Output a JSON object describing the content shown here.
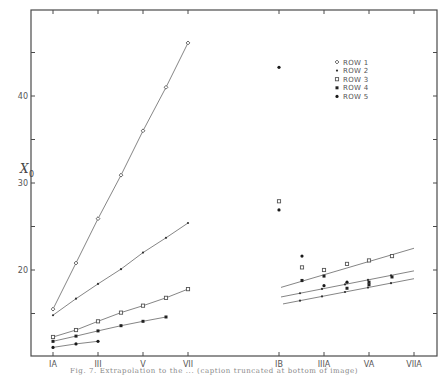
{
  "chart_data": {
    "type": "scatter",
    "title": "",
    "caption": "Fig. 7. Extrapolation to the ... (caption truncated at bottom of image)",
    "xlabel": "",
    "ylabel": "X0",
    "ylabel_main": "X",
    "ylabel_sub": "0",
    "ylim": [
      10,
      50
    ],
    "y_ticks": [
      15,
      20,
      25,
      30,
      35,
      40,
      45
    ],
    "y_tick_labels": [
      {
        "value": 20,
        "label": "20"
      },
      {
        "value": 30,
        "label": "30"
      },
      {
        "value": 40,
        "label": "40"
      }
    ],
    "grid": false,
    "legend_position": "upper right",
    "x_categories_left": [
      "IA",
      "II",
      "III",
      "IV",
      "V",
      "VI",
      "VII"
    ],
    "x_categories_right": [
      "IB",
      "IIB",
      "IIIA",
      "IVA",
      "VA",
      "VIA",
      "VIIA"
    ],
    "x_tick_labels": [
      {
        "pos": "IA",
        "label": "IA"
      },
      {
        "pos": "III",
        "label": "III"
      },
      {
        "pos": "V",
        "label": "V"
      },
      {
        "pos": "VII",
        "label": "VII"
      },
      {
        "pos": "IB",
        "label": "IB"
      },
      {
        "pos": "IIIA",
        "label": "IIIA"
      },
      {
        "pos": "VA",
        "label": "VA"
      },
      {
        "pos": "VIIA",
        "label": "VIIA"
      }
    ],
    "legend": [
      {
        "name": "ROW 1",
        "marker": "open-diamond"
      },
      {
        "name": "ROW 2",
        "marker": "small-dot"
      },
      {
        "name": "ROW 3",
        "marker": "open-square"
      },
      {
        "name": "ROW 4",
        "marker": "filled-square"
      },
      {
        "name": "ROW 5",
        "marker": "filled-dot"
      }
    ],
    "series_left": [
      {
        "name": "ROW 1",
        "marker": "open-diamond",
        "x": [
          "IA",
          "II",
          "III",
          "IV",
          "V",
          "VI",
          "VII"
        ],
        "values": [
          15.5,
          20.8,
          25.9,
          30.9,
          36.0,
          41.0,
          46.1
        ]
      },
      {
        "name": "ROW 2",
        "marker": "small-dot",
        "x": [
          "IA",
          "II",
          "III",
          "IV",
          "V",
          "VI",
          "VII"
        ],
        "values": [
          14.8,
          16.7,
          18.4,
          20.1,
          22.0,
          23.7,
          25.4
        ]
      },
      {
        "name": "ROW 3",
        "marker": "open-square",
        "x": [
          "IA",
          "II",
          "III",
          "IV",
          "V",
          "VI",
          "VII"
        ],
        "values": [
          12.3,
          13.1,
          14.1,
          15.1,
          15.9,
          16.8,
          17.8
        ]
      },
      {
        "name": "ROW 4",
        "marker": "filled-square",
        "x": [
          "IA",
          "II",
          "III",
          "IV",
          "V",
          "VI"
        ],
        "values": [
          11.8,
          12.4,
          13.0,
          13.6,
          14.1,
          14.6
        ]
      },
      {
        "name": "ROW 5",
        "marker": "filled-dot",
        "x": [
          "IA",
          "II",
          "III"
        ],
        "values": [
          11.1,
          11.5,
          11.8
        ]
      }
    ],
    "series_right_points": [
      {
        "name": "ROW 4",
        "marker": "filled-dot",
        "x": "IB",
        "value": 43.3
      },
      {
        "name": "ROW 3",
        "marker": "open-square",
        "x": "IB",
        "value": 27.9
      },
      {
        "name": "ROW 4",
        "marker": "filled-dot",
        "x": "IB",
        "value": 26.9
      },
      {
        "name": "ROW 4",
        "marker": "filled-dot",
        "x": "IIB",
        "value": 21.6
      },
      {
        "name": "ROW 3",
        "marker": "open-square",
        "x": "IIB",
        "value": 20.3
      },
      {
        "name": "ROW 4",
        "marker": "filled-square",
        "x": "IIB",
        "value": 18.8
      },
      {
        "name": "ROW 3",
        "marker": "open-square",
        "x": "IIIA",
        "value": 20.0
      },
      {
        "name": "ROW 4",
        "marker": "filled-square",
        "x": "IIIA",
        "value": 19.3
      },
      {
        "name": "ROW 5",
        "marker": "filled-dot",
        "x": "IIIA",
        "value": 18.2
      },
      {
        "name": "ROW 3",
        "marker": "open-square",
        "x": "IVA",
        "value": 20.7
      },
      {
        "name": "ROW 4",
        "marker": "filled-dot",
        "x": "IVA",
        "value": 18.6
      },
      {
        "name": "ROW 5",
        "marker": "filled-square",
        "x": "IVA",
        "value": 17.9
      },
      {
        "name": "ROW 3",
        "marker": "open-square",
        "x": "VA",
        "value": 21.1
      },
      {
        "name": "ROW 4",
        "marker": "filled-square",
        "x": "VA",
        "value": 18.6
      },
      {
        "name": "ROW 5",
        "marker": "filled-square",
        "x": "VA",
        "value": 18.3
      },
      {
        "name": "ROW 3",
        "marker": "open-square",
        "x": "VIA",
        "value": 21.6
      },
      {
        "name": "ROW 4",
        "marker": "filled-square",
        "x": "VIA",
        "value": 19.2
      }
    ],
    "fit_lines_right": [
      {
        "name": "upper",
        "from": {
          "x": 281,
          "value": 18.0
        },
        "to": {
          "x": 414,
          "value": 22.5
        }
      },
      {
        "name": "middle",
        "from": {
          "x": 281,
          "value": 16.9
        },
        "to": {
          "x": 414,
          "value": 19.9
        }
      },
      {
        "name": "lower",
        "from": {
          "x": 283,
          "value": 16.1
        },
        "to": {
          "x": 414,
          "value": 19.0
        }
      }
    ],
    "fit_line_ticks_right": [
      {
        "line": "middle",
        "x": [
          300,
          322,
          345,
          368,
          391
        ]
      },
      {
        "line": "lower",
        "x": [
          300,
          322,
          345,
          368,
          391
        ]
      },
      {
        "line": "upper",
        "x": [
          302
        ]
      }
    ]
  },
  "layout": {
    "frame": {
      "left": 31,
      "top": 10,
      "right": 437,
      "bottom": 356
    },
    "x_px": {
      "IA": 53,
      "II": 76,
      "III": 98,
      "IV": 121,
      "V": 143,
      "VI": 166,
      "VII": 188,
      "IB": 279,
      "IIB": 302,
      "IIIA": 324,
      "IVA": 347,
      "VA": 369,
      "VIA": 392,
      "VIIA": 414
    },
    "y_ref": {
      "value": 40,
      "px": 96,
      "px_per_unit": 8.7
    },
    "legend_origin": {
      "x": 337,
      "y": 62,
      "row_h": 8.6
    }
  }
}
